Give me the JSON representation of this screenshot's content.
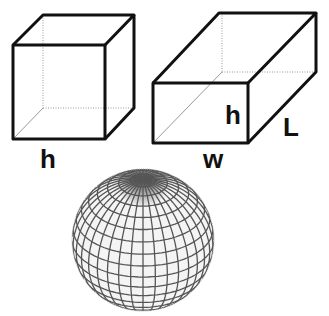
{
  "figures": {
    "cube": {
      "label": "h"
    },
    "box": {
      "height_label": "h",
      "length_label": "L",
      "width_label": "w"
    },
    "sphere": {
      "label": ""
    }
  },
  "colors": {
    "stroke": "#111111",
    "hidden_edge": "#999999",
    "sphere_grid": "#444444"
  }
}
